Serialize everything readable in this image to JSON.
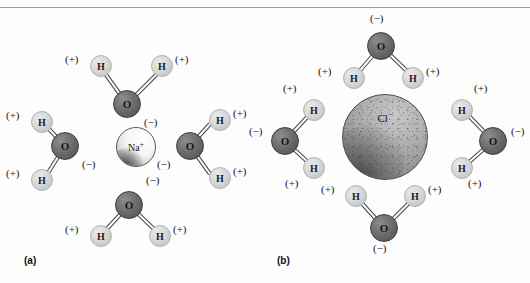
{
  "figure": {
    "background_color": "#fdfdfd",
    "colors": {
      "oxygen": "#6e6e6e",
      "hydrogen": "#d6d6d6",
      "sodium_ion": "#f2f2f2",
      "chloride_ion": "#a2a2a2",
      "text": "#151515",
      "bond_outline": "#4a4a4a",
      "bond_fill": "#fbfbfb",
      "rule": "#9a9a9a"
    },
    "labels": {
      "oxygen": "O",
      "hydrogen": "H",
      "partial_positive": "(+)",
      "partial_negative": "(−)"
    }
  },
  "panel_a": {
    "caption": "(a)",
    "ion": {
      "symbol": "Na",
      "charge": "+",
      "name": "sodium-ion"
    },
    "description": "Sodium ion surrounded by four water molecules with oxygen atoms oriented toward the cation",
    "waters": [
      {
        "position": "top",
        "oxygen_label": "O",
        "oxygen_charge": "(−)",
        "hydrogens": [
          {
            "label": "H",
            "charge": "(+)"
          },
          {
            "label": "H",
            "charge": "(+)"
          }
        ]
      },
      {
        "position": "left",
        "oxygen_label": "O",
        "oxygen_charge": "(−)",
        "hydrogens": [
          {
            "label": "H",
            "charge": "(+)"
          },
          {
            "label": "H",
            "charge": "(+)"
          }
        ]
      },
      {
        "position": "right",
        "oxygen_label": "O",
        "oxygen_charge": "(−)",
        "hydrogens": [
          {
            "label": "H",
            "charge": "(+)"
          },
          {
            "label": "H",
            "charge": "(+)"
          }
        ]
      },
      {
        "position": "bottom",
        "oxygen_label": "O",
        "oxygen_charge": "(−)",
        "hydrogens": [
          {
            "label": "H",
            "charge": "(+)"
          },
          {
            "label": "H",
            "charge": "(+)"
          }
        ]
      }
    ]
  },
  "panel_b": {
    "caption": "(b)",
    "ion": {
      "symbol": "Cl",
      "charge": "−",
      "name": "chloride-ion"
    },
    "description": "Chloride ion surrounded by four water molecules with hydrogen atoms oriented toward the anion",
    "waters": [
      {
        "position": "top",
        "oxygen_label": "O",
        "oxygen_charge": "(−)",
        "hydrogens": [
          {
            "label": "H",
            "charge": "(+)"
          },
          {
            "label": "H",
            "charge": "(+)"
          }
        ]
      },
      {
        "position": "left",
        "oxygen_label": "O",
        "oxygen_charge": "(−)",
        "hydrogens": [
          {
            "label": "H",
            "charge": "(+)"
          },
          {
            "label": "H",
            "charge": "(+)"
          }
        ]
      },
      {
        "position": "right",
        "oxygen_label": "O",
        "oxygen_charge": "(−)",
        "hydrogens": [
          {
            "label": "H",
            "charge": "(+)"
          },
          {
            "label": "H",
            "charge": "(+)"
          }
        ]
      },
      {
        "position": "bottom",
        "oxygen_label": "O",
        "oxygen_charge": "(−)",
        "hydrogens": [
          {
            "label": "H",
            "charge": "(+)"
          },
          {
            "label": "H",
            "charge": "(+)"
          }
        ]
      }
    ]
  }
}
